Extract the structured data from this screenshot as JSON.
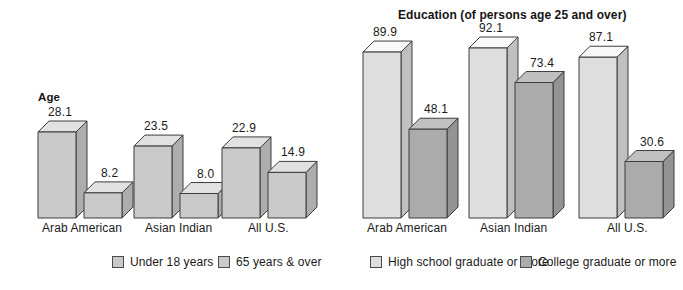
{
  "figure": {
    "background": "#ffffff",
    "baseline_y": 218
  },
  "panels": {
    "age": {
      "title": "Age",
      "categories": [
        "Arab American",
        "Asian Indian",
        "All U.S."
      ]
    },
    "education": {
      "title": "Education (of persons age 25 and over)",
      "categories": [
        "Arab American",
        "Asian Indian",
        "All U.S."
      ]
    }
  },
  "legend": {
    "items": [
      {
        "label": "Under 18 years",
        "color": "#c9c9c9"
      },
      {
        "label": "65 years & over",
        "color": "#c9c9c9"
      },
      {
        "label": "High school graduate or more",
        "color": "#dedede"
      },
      {
        "label": "College graduate or more",
        "color": "#ababab"
      }
    ]
  },
  "values": {
    "age": {
      "arab_under18": "28.1",
      "arab_65over": "8.2",
      "asian_under18": "23.5",
      "asian_65over": "8.0",
      "allus_under18": "22.9",
      "allus_65over": "14.9"
    },
    "education": {
      "arab_hs": "89.9",
      "arab_college": "48.1",
      "asian_hs": "92.1",
      "asian_college": "73.4",
      "allus_hs": "87.1",
      "allus_college": "30.6"
    }
  },
  "chart_data": [
    {
      "type": "bar",
      "title": "Age",
      "subtitle": "",
      "xlabel": "",
      "ylabel": "",
      "categories": [
        "Arab American",
        "Asian Indian",
        "All U.S."
      ],
      "series": [
        {
          "name": "Under 18 years",
          "values": [
            28.1,
            23.5,
            22.9
          ],
          "color": "#c9c9c9"
        },
        {
          "name": "65 years & over",
          "values": [
            8.2,
            8.0,
            14.9
          ],
          "color": "#c9c9c9"
        }
      ],
      "data_labels": [
        [
          "28.1",
          "8.2"
        ],
        [
          "23.5",
          "8.0"
        ],
        [
          "22.9",
          "14.9"
        ]
      ],
      "ylim": [
        0,
        30
      ],
      "grid": false,
      "legend_position": "bottom",
      "style": "3d-isometric-bars"
    },
    {
      "type": "bar",
      "title": "Education (of persons age 25 and over)",
      "subtitle": "",
      "xlabel": "",
      "ylabel": "",
      "categories": [
        "Arab American",
        "Asian Indian",
        "All U.S."
      ],
      "series": [
        {
          "name": "High school graduate or more",
          "values": [
            89.9,
            92.1,
            87.1
          ],
          "color": "#dedede"
        },
        {
          "name": "College graduate or more",
          "values": [
            48.1,
            73.4,
            30.6
          ],
          "color": "#ababab"
        }
      ],
      "data_labels": [
        [
          "89.9",
          "48.1"
        ],
        [
          "92.1",
          "73.4"
        ],
        [
          "87.1",
          "30.6"
        ]
      ],
      "ylim": [
        0,
        100
      ],
      "grid": false,
      "legend_position": "bottom",
      "style": "3d-isometric-bars"
    }
  ]
}
